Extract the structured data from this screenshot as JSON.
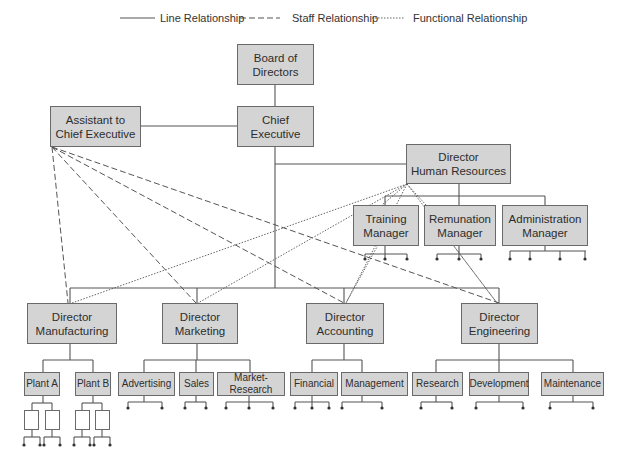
{
  "legend": {
    "line": "Line Relationship",
    "staff": "Staff Relationship",
    "functional": "Functional Relationship"
  },
  "colors": {
    "box_fill": "#d4d4d4",
    "box_border": "#6a6a6a",
    "line": "#555555",
    "background": "#ffffff"
  },
  "nodes": {
    "board": {
      "line1": "Board of",
      "line2": "Directors"
    },
    "chief": {
      "line1": "Chief",
      "line2": "Executive"
    },
    "assistant": {
      "line1": "Assistant to",
      "line2": "Chief Executive"
    },
    "hr": {
      "line1": "Director",
      "line2": "Human Resources"
    },
    "training": {
      "line1": "Training",
      "line2": "Manager"
    },
    "remunation": {
      "line1": "Remunation",
      "line2": "Manager"
    },
    "administration": {
      "line1": "Administration",
      "line2": "Manager"
    },
    "manufacturing": {
      "line1": "Director",
      "line2": "Manufacturing"
    },
    "marketing": {
      "line1": "Director",
      "line2": "Marketing"
    },
    "accounting": {
      "line1": "Director",
      "line2": "Accounting"
    },
    "engineering": {
      "line1": "Director",
      "line2": "Engineering"
    },
    "plant_a": {
      "label": "Plant A"
    },
    "plant_b": {
      "label": "Plant B"
    },
    "advertising": {
      "label": "Advertising"
    },
    "sales": {
      "label": "Sales"
    },
    "market_research": {
      "label": "Market-Research"
    },
    "financial": {
      "label": "Financial"
    },
    "management": {
      "label": "Management"
    },
    "research": {
      "label": "Research"
    },
    "development": {
      "label": "Development"
    },
    "maintenance": {
      "label": "Maintenance"
    }
  }
}
